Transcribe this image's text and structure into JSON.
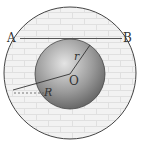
{
  "diagram": {
    "labels": {
      "point_a": "A",
      "point_b": "B",
      "center": "O",
      "inner_radius": "r",
      "outer_radius": "R"
    },
    "colors": {
      "outline": "#444444",
      "brick_fill": "#f1f1f1",
      "brick_lines": "#e2e2e2",
      "sphere_light": "#d8d8d8",
      "sphere_dark": "#5a5a5a"
    },
    "geometry": {
      "outer_circle": {
        "cx": 70,
        "cy": 73,
        "r": 66
      },
      "inner_sphere": {
        "cx": 70,
        "cy": 73,
        "r": 35
      },
      "chord_ab": {
        "x1": 20,
        "y1": 38,
        "x2": 122,
        "y2": 38
      }
    }
  }
}
